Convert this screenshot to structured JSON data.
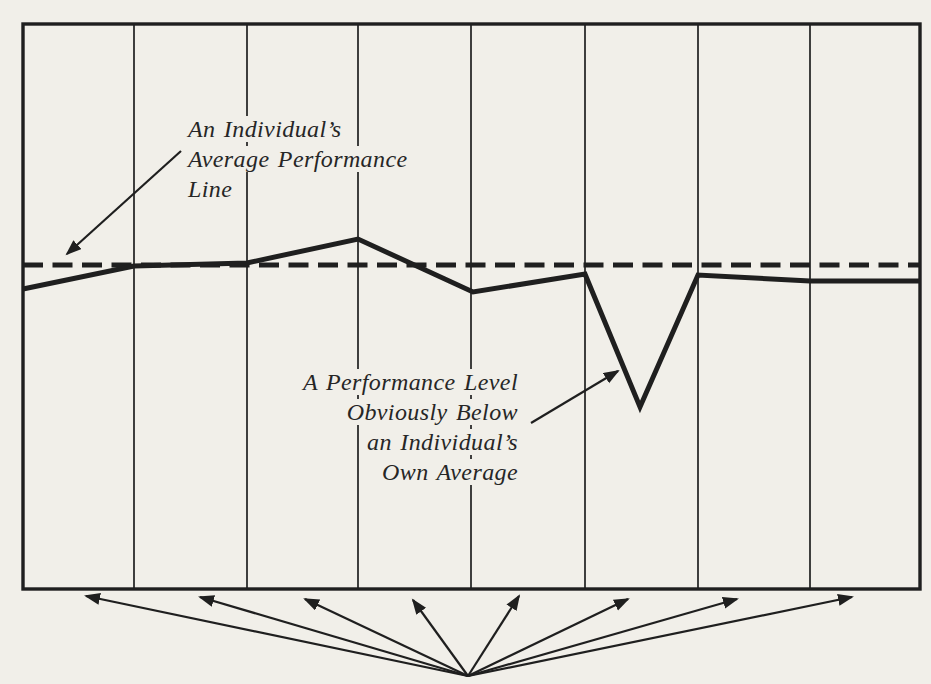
{
  "colors": {
    "ink": "#1f1f1f",
    "paper": "#f1efe9",
    "text": "#262626"
  },
  "chart_data": {
    "type": "line",
    "title": "",
    "xlabel": "",
    "ylabel": "",
    "legend": "none",
    "grid": "vertical-columns-only",
    "columns": 8,
    "axis_tick_labels": [],
    "frame_px": {
      "left": 23,
      "top": 24,
      "right": 920,
      "bottom": 589
    },
    "grid_x_px": [
      134,
      247,
      358,
      471,
      585,
      698,
      810
    ],
    "average_line": {
      "style": "dashed",
      "y_px": 265
    },
    "performance_line": {
      "points_px": [
        [
          23,
          289
        ],
        [
          134,
          266
        ],
        [
          247,
          263
        ],
        [
          358,
          239
        ],
        [
          473,
          292
        ],
        [
          585,
          274
        ],
        [
          640,
          407
        ],
        [
          698,
          275
        ],
        [
          810,
          281
        ],
        [
          920,
          281
        ]
      ],
      "x_fraction": [
        0,
        0.124,
        0.25,
        0.373,
        0.502,
        0.627,
        0.688,
        0.753,
        0.877,
        1
      ],
      "deviation_from_average_pct_of_chart_height": [
        -4.2,
        -0.2,
        0.4,
        4.6,
        -4.8,
        -1.6,
        -25.1,
        -1.8,
        -2.8,
        -2.8
      ]
    }
  },
  "annotations": {
    "average_label": {
      "lines": [
        "An Individual’s",
        "Average Performance",
        "Line"
      ],
      "arrow_px": {
        "from": [
          181,
          151
        ],
        "to": [
          67,
          254
        ]
      }
    },
    "dip_label": {
      "lines": [
        "A Performance Level",
        "Obviously Below",
        "an Individual’s",
        "Own Average"
      ],
      "arrow_px": {
        "from": [
          531,
          423
        ],
        "to": [
          618,
          371
        ]
      }
    },
    "fan": {
      "origin_px": [
        468,
        676
      ],
      "targets_px": [
        [
          86,
          596
        ],
        [
          200,
          597
        ],
        [
          305,
          599
        ],
        [
          413,
          600
        ],
        [
          519,
          596
        ],
        [
          628,
          599
        ],
        [
          737,
          599
        ],
        [
          852,
          597
        ]
      ]
    }
  }
}
